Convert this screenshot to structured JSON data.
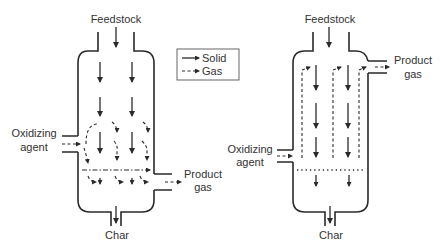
{
  "legend": {
    "items": [
      {
        "label": "Solid",
        "style": "solid-arrow"
      },
      {
        "label": "Gas",
        "style": "dashed-arrow"
      }
    ]
  },
  "gasifiers": [
    {
      "id": "left",
      "type": "downdraft-cross",
      "labels": {
        "feed": "Feedstock",
        "oxidizer_line1": "Oxidizing",
        "oxidizer_line2": "agent",
        "product_line1": "Product",
        "product_line2": "gas",
        "char": "Char"
      }
    },
    {
      "id": "right",
      "type": "updraft-product-top",
      "labels": {
        "feed": "Feedstock",
        "oxidizer_line1": "Oxidizing",
        "oxidizer_line2": "agent",
        "product_line1": "Product",
        "product_line2": "gas",
        "char": "Char"
      }
    }
  ],
  "colors": {
    "line": "#2a2a2a",
    "text": "#333333",
    "background": "#ffffff"
  }
}
